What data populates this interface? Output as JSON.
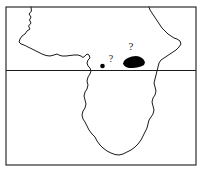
{
  "figure": {
    "name": "africa-distribution-map",
    "type": "distribution-map",
    "region": "Africa",
    "background_color": "#ffffff",
    "line_color": "#1a1a1a",
    "fill_color": "#000000"
  },
  "frame": {
    "name": "map-border",
    "x": 6,
    "y": 7,
    "width": 190,
    "height": 158,
    "stroke_width": 1.1
  },
  "graticule": {
    "lines": [
      {
        "name": "equator",
        "label": "",
        "orientation": "horizontal",
        "y": 70.5,
        "x1": 6,
        "x2": 196,
        "stroke_width": 1.0
      }
    ]
  },
  "coastline": {
    "name": "africa-coastline",
    "stroke_width": 1.0,
    "path": "M 31,7 L 31.5,11 L 29,14 L 31,17 L 29.5,20 L 31,23 L 28.5,26 L 30,29 L 27,31 L 25,34 L 22,36 L 20,39 L 19,42 L 21,44 L 24,45 L 27,46.5 L 30,48 L 34,50 L 38,52 L 42,54 L 46,55.5 L 50,56 L 54,55 L 57,54 L 59,55 L 62,56 L 66,56 L 70,55.5 L 74,55 L 78,55 L 81,56 L 83,57.5 L 85,56 L 87,54 L 89,55 L 90,58 L 88,60 L 87,63 L 88,66 L 90,68 L 91,71 L 90,74 L 88,77 L 87,81 L 88,85 L 87,89 L 85,92 L 84,96 L 85,100 L 86,104 L 85,108 L 83,111 L 82,115 L 83,119 L 85,122 L 87,126 L 89,130 L 92,134 L 95,137 L 97,141 L 100,145 L 103,148 L 107,151 L 111,153 L 115,154.5 L 119,155 L 123,154 L 127,152 L 131,150 L 135,147 L 138,144 L 141,140 L 143,136 L 145,132 L 147,128 L 148,124 L 149,120 L 151,117 L 153,114 L 154,110 L 153,106 L 152,102 L 153,98 L 155,95 L 156,91 L 155,87 L 154,83 L 155,79 L 156,75 L 157,71 L 158,67 L 159,63 L 161,60 L 164,58 L 167,56 L 170,54 L 173,52 L 176,50 L 179,47 L 181,44 L 180,41 L 177,39 L 174,38 L 171,36 L 168,34 L 165,31 L 162,28 L 160,25 L 158,22 L 156,19 L 154,16 L 152,13 L 150,10 L 149,7"
  },
  "markers": [
    {
      "name": "distribution-polygon",
      "kind": "filled-range-blob",
      "label": "",
      "fill": "#000000",
      "path": "M 123,63.5 L 124,61 L 126,59 L 129,57.5 L 132,56.5 L 136,56 L 139,56.5 L 142,58 L 144,60 L 145,62.5 L 144,65 L 141,66.5 L 137,67.5 L 133,68 L 129,68 L 126,67 L 124,65.5 Z"
    },
    {
      "name": "distribution-point",
      "kind": "filled-dot",
      "label": "",
      "fill": "#000000",
      "cx": 102.5,
      "cy": 66,
      "r": 2.3
    }
  ],
  "annotations": [
    {
      "name": "query-mark-upper",
      "text": "?",
      "x": 131,
      "y": 49.5,
      "font_size": 11
    },
    {
      "name": "query-mark-lower",
      "text": "?",
      "x": 111,
      "y": 61.5,
      "font_size": 10
    }
  ]
}
